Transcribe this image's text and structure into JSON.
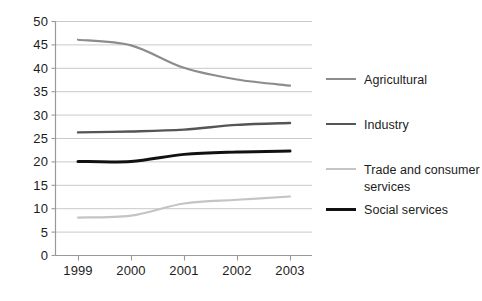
{
  "chart_data": {
    "type": "line",
    "title": "",
    "xlabel": "",
    "ylabel": "",
    "categories": [
      "1999",
      "2000",
      "2001",
      "2002",
      "2003"
    ],
    "x": [
      1999,
      2000,
      2001,
      2002,
      2003
    ],
    "xlim": [
      1999,
      2003
    ],
    "ylim": [
      0,
      50
    ],
    "yticks": [
      "0",
      "5",
      "10",
      "15",
      "20",
      "25",
      "30",
      "35",
      "40",
      "45",
      "50"
    ],
    "ytick_values": [
      0,
      5,
      10,
      15,
      20,
      25,
      30,
      35,
      40,
      45,
      50
    ],
    "grid": "horizontal",
    "legend_position": "right",
    "series": [
      {
        "name": "Agricultural",
        "values": [
          46.0,
          44.8,
          40.0,
          37.5,
          36.2
        ],
        "color": "#8c8c8c",
        "width": 2.2
      },
      {
        "name": "Industry",
        "values": [
          26.2,
          26.4,
          26.8,
          27.8,
          28.2
        ],
        "color": "#555555",
        "width": 2.4
      },
      {
        "name": "Trade and consumer\nservices",
        "values": [
          8.0,
          8.4,
          11.0,
          11.8,
          12.5
        ],
        "color": "#c4c4c4",
        "width": 2.2
      },
      {
        "name": "Social services",
        "values": [
          20.0,
          20.0,
          21.5,
          22.0,
          22.2
        ],
        "color": "#111111",
        "width": 3.0
      }
    ]
  },
  "axes": {
    "axis_color": "#999999",
    "grid_color": "#c9c9c9",
    "tick_color": "#999999"
  },
  "legend": {
    "entries": [
      {
        "label": "Agricultural"
      },
      {
        "label": "Industry"
      },
      {
        "label": "Trade and consumer\nservices"
      },
      {
        "label": "Social services"
      }
    ]
  }
}
